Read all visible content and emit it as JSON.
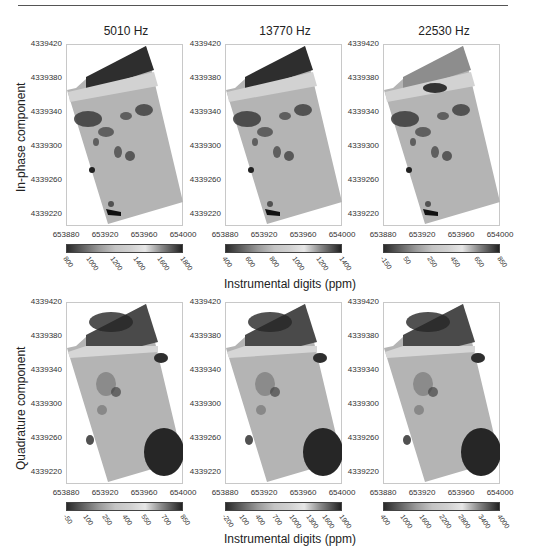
{
  "figure": {
    "column_titles": [
      "5010 Hz",
      "13770 Hz",
      "22530 Hz"
    ],
    "row_labels": [
      "In-phase component",
      "Quadrature component"
    ],
    "colorbar_title": "Instrumental digits (ppm)"
  },
  "chart_data": [
    {
      "type": "heatmap",
      "title": "5010 Hz",
      "row": "In-phase component",
      "xlabel": "",
      "ylabel": "In-phase component",
      "x_ticks": [
        "653880",
        "653920",
        "653960",
        "654000"
      ],
      "y_ticks": [
        "4339420",
        "4339380",
        "4339340",
        "4339300",
        "4339260",
        "4339220"
      ],
      "xlim": [
        653880,
        654000
      ],
      "ylim": [
        4339210,
        4339425
      ],
      "colorbar": {
        "label": "Instrumental digits (ppm)",
        "ticks": [
          800,
          1000,
          1200,
          1400,
          1600,
          1800
        ]
      },
      "grid": false
    },
    {
      "type": "heatmap",
      "title": "13770 Hz",
      "row": "In-phase component",
      "x_ticks": [
        "653880",
        "653920",
        "653960",
        "654000"
      ],
      "y_ticks": [
        "4339420",
        "4339380",
        "4339340",
        "4339300",
        "4339260",
        "4339220"
      ],
      "xlim": [
        653880,
        654000
      ],
      "ylim": [
        4339210,
        4339425
      ],
      "colorbar": {
        "label": "Instrumental digits (ppm)",
        "ticks": [
          400,
          600,
          800,
          1000,
          1200,
          1400
        ]
      },
      "grid": false
    },
    {
      "type": "heatmap",
      "title": "22530 Hz",
      "row": "In-phase component",
      "x_ticks": [
        "653880",
        "653920",
        "653960",
        "654000"
      ],
      "y_ticks": [
        "4339420",
        "4339380",
        "4339340",
        "4339300",
        "4339260",
        "4339220"
      ],
      "xlim": [
        653880,
        654000
      ],
      "ylim": [
        4339210,
        4339425
      ],
      "colorbar": {
        "label": "Instrumental digits (ppm)",
        "ticks": [
          -150,
          50,
          250,
          450,
          650,
          850
        ]
      },
      "grid": false
    },
    {
      "type": "heatmap",
      "title": "5010 Hz",
      "row": "Quadrature component",
      "ylabel": "Quadrature component",
      "x_ticks": [
        "653880",
        "653920",
        "653960",
        "654000"
      ],
      "y_ticks": [
        "4339420",
        "4339380",
        "4339340",
        "4339300",
        "4339260",
        "4339220"
      ],
      "xlim": [
        653880,
        654000
      ],
      "ylim": [
        4339210,
        4339425
      ],
      "colorbar": {
        "label": "Instrumental digits (ppm)",
        "ticks": [
          -50,
          100,
          250,
          400,
          550,
          700,
          850
        ]
      },
      "grid": false
    },
    {
      "type": "heatmap",
      "title": "13770 Hz",
      "row": "Quadrature component",
      "x_ticks": [
        "653880",
        "653920",
        "653960",
        "654000"
      ],
      "y_ticks": [
        "4339420",
        "4339380",
        "4339340",
        "4339300",
        "4339260",
        "4339220"
      ],
      "xlim": [
        653880,
        654000
      ],
      "ylim": [
        4339210,
        4339425
      ],
      "colorbar": {
        "label": "Instrumental digits (ppm)",
        "ticks": [
          -200,
          100,
          400,
          700,
          1000,
          1300,
          1600,
          1900
        ]
      },
      "grid": false
    },
    {
      "type": "heatmap",
      "title": "22530 Hz",
      "row": "Quadrature component",
      "x_ticks": [
        "653880",
        "653920",
        "653960",
        "654000"
      ],
      "y_ticks": [
        "4339420",
        "4339380",
        "4339340",
        "4339300",
        "4339260",
        "4339220"
      ],
      "xlim": [
        653880,
        654000
      ],
      "ylim": [
        4339210,
        4339425
      ],
      "colorbar": {
        "label": "Instrumental digits (ppm)",
        "ticks": [
          400,
          1000,
          1600,
          2200,
          2800,
          3400,
          4000
        ]
      },
      "grid": false
    }
  ]
}
